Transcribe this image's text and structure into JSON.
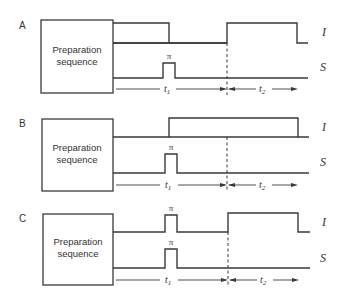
{
  "figure": {
    "panels": [
      {
        "id": "A",
        "label": "A",
        "box_text_line1": "Preparation",
        "box_text_line2": "sequence",
        "channel_I_label": "I",
        "channel_S_label": "S",
        "I_pulses": [
          {
            "type": "long",
            "start": "box-end",
            "end": "t1-mid"
          },
          {
            "type": "long",
            "start": "t2-start",
            "end": "t2-end"
          }
        ],
        "S_pulses": [
          {
            "type": "pi",
            "label": "π",
            "position": "t1-mid"
          }
        ],
        "pi_label_S": "π",
        "t1_label": "t",
        "t1_sub": "1",
        "t2_label": "t",
        "t2_sub": "2"
      },
      {
        "id": "B",
        "label": "B",
        "box_text_line1": "Preparation",
        "box_text_line2": "sequence",
        "channel_I_label": "I",
        "channel_S_label": "S",
        "I_pulses": [
          {
            "type": "long",
            "start": "t1-mid",
            "end": "t2-end"
          }
        ],
        "S_pulses": [
          {
            "type": "pi",
            "label": "π",
            "position": "t1-mid"
          }
        ],
        "pi_label_S": "π",
        "t1_label": "t",
        "t1_sub": "1",
        "t2_label": "t",
        "t2_sub": "2"
      },
      {
        "id": "C",
        "label": "C",
        "box_text_line1": "Preparation",
        "box_text_line2": "sequence",
        "channel_I_label": "I",
        "channel_S_label": "S",
        "I_pulses": [
          {
            "type": "pi",
            "label": "π",
            "position": "t1-mid"
          },
          {
            "type": "long",
            "start": "t2-start",
            "end": "t2-end"
          }
        ],
        "S_pulses": [
          {
            "type": "pi",
            "label": "π",
            "position": "t1-mid"
          }
        ],
        "pi_label_I": "π",
        "pi_label_S": "π",
        "t1_label": "t",
        "t1_sub": "1",
        "t2_label": "t",
        "t2_sub": "2"
      }
    ]
  }
}
